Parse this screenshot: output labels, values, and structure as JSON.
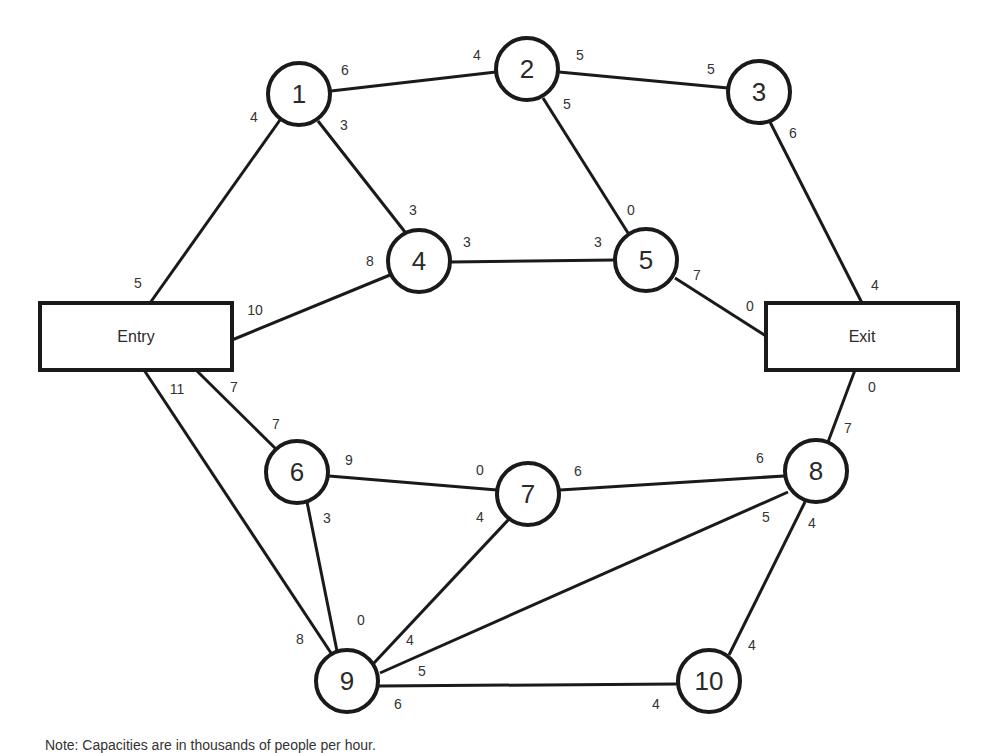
{
  "diagram": {
    "type": "network-flow",
    "nodes": [
      {
        "id": "entry",
        "label": "Entry",
        "shape": "box",
        "x": 40,
        "y": 303,
        "w": 192,
        "h": 67
      },
      {
        "id": "exit",
        "label": "Exit",
        "shape": "box",
        "x": 766,
        "y": 303,
        "w": 192,
        "h": 67
      },
      {
        "id": "1",
        "label": "1",
        "shape": "circle",
        "cx": 299,
        "cy": 94,
        "r": 31
      },
      {
        "id": "2",
        "label": "2",
        "shape": "circle",
        "cx": 527,
        "cy": 69,
        "r": 31
      },
      {
        "id": "3",
        "label": "3",
        "shape": "circle",
        "cx": 759,
        "cy": 92,
        "r": 31
      },
      {
        "id": "4",
        "label": "4",
        "shape": "circle",
        "cx": 419,
        "cy": 261,
        "r": 31
      },
      {
        "id": "5",
        "label": "5",
        "shape": "circle",
        "cx": 646,
        "cy": 260,
        "r": 31
      },
      {
        "id": "6",
        "label": "6",
        "shape": "circle",
        "cx": 297,
        "cy": 472,
        "r": 31
      },
      {
        "id": "7",
        "label": "7",
        "shape": "circle",
        "cx": 528,
        "cy": 494,
        "r": 31
      },
      {
        "id": "8",
        "label": "8",
        "shape": "circle",
        "cx": 816,
        "cy": 471,
        "r": 31
      },
      {
        "id": "9",
        "label": "9",
        "shape": "circle",
        "cx": 347,
        "cy": 681,
        "r": 31
      },
      {
        "id": "10",
        "label": "10",
        "shape": "circle",
        "cx": 709,
        "cy": 681,
        "r": 31
      }
    ],
    "edges": [
      {
        "from": "entry",
        "to": "1",
        "x1": 150,
        "y1": 303,
        "x2": 280,
        "y2": 120,
        "cap_from": "5",
        "cap_to": "4",
        "lf": [
          138,
          283
        ],
        "lt": [
          254,
          117
        ]
      },
      {
        "from": "entry",
        "to": "4",
        "x1": 232,
        "y1": 340,
        "x2": 390,
        "y2": 275,
        "cap_from": "10",
        "cap_to": "8",
        "lf": [
          255,
          310
        ],
        "lt": [
          370,
          261
        ]
      },
      {
        "from": "entry",
        "to": "6",
        "x1": 196,
        "y1": 370,
        "x2": 276,
        "y2": 449,
        "cap_from": "7",
        "cap_to": "7",
        "lf": [
          234,
          387
        ],
        "lt": [
          276,
          424
        ]
      },
      {
        "from": "entry",
        "to": "9",
        "x1": 144,
        "y1": 370,
        "x2": 331,
        "y2": 653,
        "cap_from": "11",
        "cap_to": "8",
        "lf": [
          177,
          389
        ],
        "lt": [
          300,
          639
        ]
      },
      {
        "from": "1",
        "to": "2",
        "x1": 331,
        "y1": 91,
        "x2": 496,
        "y2": 72,
        "cap_from": "6",
        "cap_to": "4",
        "lf": [
          345,
          70
        ],
        "lt": [
          477,
          55
        ]
      },
      {
        "from": "1",
        "to": "4",
        "x1": 318,
        "y1": 121,
        "x2": 405,
        "y2": 232,
        "cap_from": "3",
        "cap_to": "3",
        "lf": [
          344,
          125
        ],
        "lt": [
          413,
          210
        ]
      },
      {
        "from": "2",
        "to": "3",
        "x1": 559,
        "y1": 72,
        "x2": 728,
        "y2": 88,
        "cap_from": "5",
        "cap_to": "5",
        "lf": [
          580,
          55
        ],
        "lt": [
          711,
          69
        ]
      },
      {
        "from": "2",
        "to": "5",
        "x1": 543,
        "y1": 98,
        "x2": 628,
        "y2": 233,
        "cap_from": "5",
        "cap_to": "0",
        "lf": [
          567,
          104
        ],
        "lt": [
          631,
          210
        ]
      },
      {
        "from": "3",
        "to": "exit",
        "x1": 770,
        "y1": 122,
        "x2": 862,
        "y2": 303,
        "cap_from": "6",
        "cap_to": "4",
        "lf": [
          793,
          133
        ],
        "lt": [
          875,
          285
        ]
      },
      {
        "from": "4",
        "to": "5",
        "x1": 451,
        "y1": 262,
        "x2": 615,
        "y2": 260,
        "cap_from": "3",
        "cap_to": "3",
        "lf": [
          467,
          242
        ],
        "lt": [
          598,
          242
        ]
      },
      {
        "from": "5",
        "to": "exit",
        "x1": 675,
        "y1": 278,
        "x2": 766,
        "y2": 336,
        "cap_from": "7",
        "cap_to": "0",
        "lf": [
          697,
          275
        ],
        "lt": [
          750,
          306
        ]
      },
      {
        "from": "exit",
        "to": "8",
        "x1": 855,
        "y1": 370,
        "x2": 828,
        "y2": 442,
        "cap_from": "0",
        "cap_to": "7",
        "lf": [
          872,
          387
        ],
        "lt": [
          848,
          428
        ]
      },
      {
        "from": "6",
        "to": "7",
        "x1": 329,
        "y1": 476,
        "x2": 497,
        "y2": 490,
        "cap_from": "9",
        "cap_to": "0",
        "lf": [
          349,
          460
        ],
        "lt": [
          480,
          470
        ]
      },
      {
        "from": "6",
        "to": "9",
        "x1": 307,
        "y1": 502,
        "x2": 337,
        "y2": 651,
        "cap_from": "3",
        "cap_to": "0",
        "lf": [
          327,
          518
        ],
        "lt": [
          361,
          620
        ]
      },
      {
        "from": "7",
        "to": "8",
        "x1": 560,
        "y1": 490,
        "x2": 784,
        "y2": 476,
        "cap_from": "6",
        "cap_to": "6",
        "lf": [
          578,
          471
        ],
        "lt": [
          760,
          458
        ]
      },
      {
        "from": "7",
        "to": "9",
        "x1": 509,
        "y1": 519,
        "x2": 374,
        "y2": 663,
        "cap_from": "4",
        "cap_to": "4",
        "lf": [
          480,
          517
        ],
        "lt": [
          410,
          640
        ]
      },
      {
        "from": "8",
        "to": "9",
        "x1": 788,
        "y1": 492,
        "x2": 380,
        "y2": 673,
        "cap_from": "5",
        "cap_to": "5",
        "lf": [
          766,
          517
        ],
        "lt": [
          422,
          671
        ]
      },
      {
        "from": "8",
        "to": "10",
        "x1": 805,
        "y1": 502,
        "x2": 729,
        "y2": 655,
        "cap_from": "4",
        "cap_to": "4",
        "lf": [
          812,
          523
        ],
        "lt": [
          752,
          645
        ]
      },
      {
        "from": "9",
        "to": "10",
        "x1": 379,
        "y1": 686,
        "x2": 678,
        "y2": 684,
        "cap_from": "6",
        "cap_to": "4",
        "lf": [
          398,
          704
        ],
        "lt": [
          656,
          704
        ]
      }
    ]
  },
  "note": {
    "text": "Note: Capacities are in thousands of people per hour."
  }
}
